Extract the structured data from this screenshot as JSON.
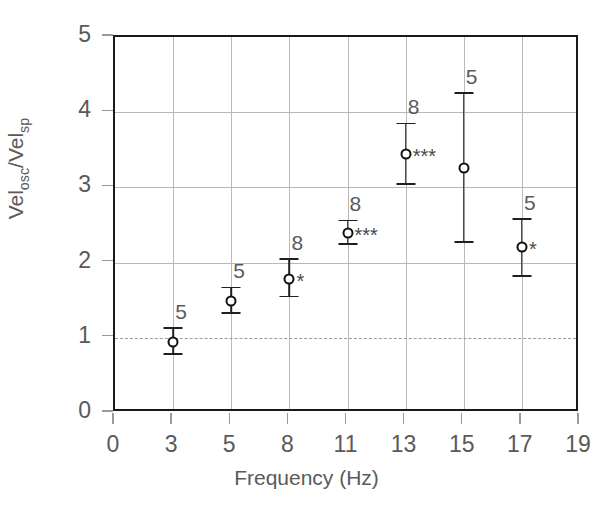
{
  "chart_data": {
    "type": "scatter",
    "title": "",
    "xlabel": "Frequency (Hz)",
    "ylabel": "Vel",
    "ylabel_sub1": "osc",
    "ylabel_mid": "/Vel",
    "ylabel_sub2": "sp",
    "ylabel_plain": "Velosc/Velsp",
    "x_ticklabels": [
      "0",
      "3",
      "5",
      "8",
      "11",
      "13",
      "15",
      "17",
      "19"
    ],
    "y_ticklabels": [
      "0",
      "1",
      "2",
      "3",
      "4",
      "5"
    ],
    "ylim": [
      0,
      5
    ],
    "xlim_categories": [
      "0",
      "3",
      "5",
      "8",
      "11",
      "13",
      "15",
      "17",
      "19"
    ],
    "grid": "both",
    "reference_line": {
      "y": 1,
      "style": "dashed",
      "label": ""
    },
    "legend": "none",
    "categories": [
      3,
      5,
      8,
      11,
      13,
      15,
      17
    ],
    "values": [
      0.95,
      1.49,
      1.78,
      2.4,
      3.44,
      3.26,
      2.21
    ],
    "err_low": [
      0.78,
      1.33,
      1.55,
      2.25,
      3.04,
      2.27,
      1.82
    ],
    "err_high": [
      1.13,
      1.67,
      2.05,
      2.56,
      3.85,
      4.26,
      2.58
    ],
    "n_labels": [
      "5",
      "5",
      "8",
      "8",
      "8",
      "5",
      "5"
    ],
    "significance": [
      "",
      "",
      "*",
      "***",
      "***",
      "",
      "*"
    ],
    "marker": "open-circle",
    "colors": {
      "marker": "#111111",
      "error": "#1f1f1f",
      "grid": "#b9b9b9",
      "frame": "#1a1a1a",
      "text": "#595959"
    }
  }
}
